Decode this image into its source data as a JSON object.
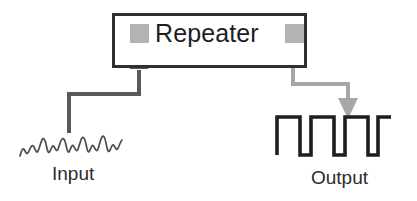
{
  "canvas": {
    "width": 417,
    "height": 201,
    "background": "#ffffff"
  },
  "diagram": {
    "type": "block-diagram",
    "device": {
      "label": "Repeater",
      "box": {
        "x": 112,
        "y": 13,
        "width": 195,
        "height": 55
      },
      "border_color": "#2f2f2f",
      "border_width": 3,
      "fill": "#ffffff",
      "ports": [
        {
          "name": "input-port",
          "shape": "square",
          "x": 130,
          "y": 24,
          "size": 19,
          "color": "#b3b3b3"
        },
        {
          "name": "output-port",
          "shape": "square",
          "x": 285,
          "y": 24,
          "size": 19,
          "color": "#b3b3b3"
        }
      ]
    },
    "connectors": [
      {
        "name": "input-connector",
        "color": "#58595b",
        "width": 4,
        "arrow": "up",
        "arrow_color": "#58595b",
        "path": "M69,132 L69,94 L139,94 L139,68"
      },
      {
        "name": "output-connector",
        "color": "#a6a6a6",
        "width": 4,
        "arrow": "down",
        "arrow_color": "#a6a6a6",
        "path": "M293,45 L293,84 L348,84 L348,110"
      }
    ],
    "signals": [
      {
        "name": "input-waveform",
        "kind": "analog-noisy",
        "label": "Input",
        "color": "#4d4d4d",
        "stroke_width": 1.6,
        "cycles": 5,
        "baseline_y": 155,
        "amplitude": 13,
        "x_start": 20,
        "x_end": 122
      },
      {
        "name": "output-waveform",
        "kind": "digital-square",
        "label": "Output",
        "color": "#1e1e1e",
        "stroke_width": 3.5,
        "pulses": 5,
        "high_y": 116,
        "low_y": 155,
        "x_start": 277,
        "x_end": 391
      }
    ],
    "labels": {
      "device": "Repeater",
      "input": "Input",
      "output": "Output"
    },
    "colors": {
      "box_border": "#2f2f2f",
      "port_gray": "#b3b3b3",
      "input_line": "#58595b",
      "output_line": "#a6a6a6",
      "wave_dark": "#1e1e1e",
      "text": "#262626",
      "background": "#ffffff"
    }
  }
}
